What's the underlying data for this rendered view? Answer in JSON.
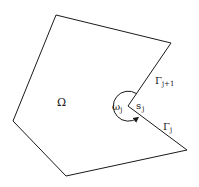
{
  "diagram": {
    "region_label": "Ω",
    "angle_label": {
      "main": "ω",
      "sub": "j"
    },
    "vertex_label": {
      "main": "s",
      "sub": "j"
    },
    "edge_upper_label": {
      "main": "Γ",
      "sub": "j+1"
    },
    "edge_lower_label": {
      "main": "Γ",
      "sub": "j"
    },
    "polygon_vertices": [
      [
        56,
        15
      ],
      [
        171,
        43
      ],
      [
        128,
        106
      ],
      [
        187,
        150
      ],
      [
        66,
        176
      ],
      [
        13,
        121
      ]
    ],
    "colors": {
      "stroke": "#1a1a1a",
      "background": "#ffffff"
    }
  }
}
